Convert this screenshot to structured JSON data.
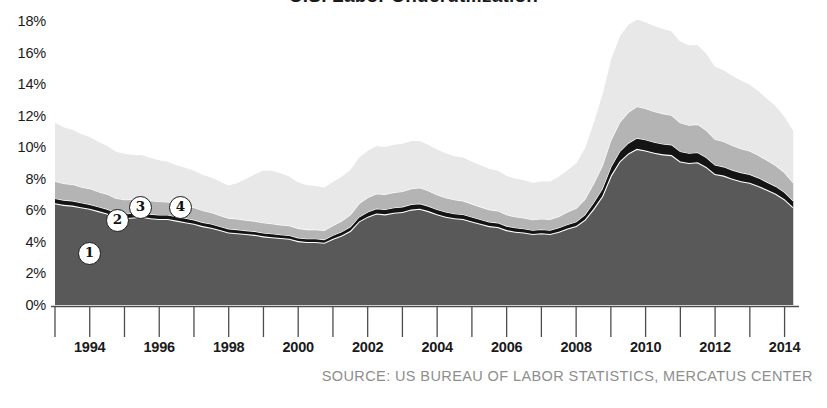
{
  "title": "U.S. Labor Underutilization",
  "source_note": "SOURCE: US BUREAU OF LABOR STATISTICS, MERCATUS CENTER",
  "axes": {
    "y_ticks": [
      "18%",
      "16%",
      "14%",
      "12%",
      "10%",
      "8%",
      "6%",
      "4%",
      "2%",
      "0%"
    ],
    "x_ticks": [
      "1994",
      "1996",
      "1998",
      "2000",
      "2002",
      "2004",
      "2006",
      "2008",
      "2010",
      "2012",
      "2014"
    ]
  },
  "markers": [
    {
      "label": "1",
      "x": 88,
      "y": 252
    },
    {
      "label": "2",
      "x": 116,
      "y": 219
    },
    {
      "label": "3",
      "x": 139,
      "y": 206
    },
    {
      "label": "4",
      "x": 179,
      "y": 206
    }
  ],
  "colors": {
    "series_1": "#595959",
    "series_2": "#141414",
    "series_3": "#b4b4b4",
    "series_4": "#e8e8e8",
    "separator": "#ffffff",
    "axis": "#4d4d4d",
    "source_text": "#8e8e8e",
    "background": "#ffffff"
  },
  "chart_data": {
    "type": "area",
    "stacked": true,
    "title": "U.S. Labor Underutilization",
    "xlabel": "",
    "ylabel": "",
    "ylim": [
      0,
      18
    ],
    "xlim": [
      1993.0,
      2014.3
    ],
    "grid": false,
    "legend": "none",
    "y_unit": "percent",
    "x": [
      1993.0,
      1993.25,
      1993.5,
      1993.75,
      1994.0,
      1994.25,
      1994.5,
      1994.75,
      1995.0,
      1995.25,
      1995.5,
      1995.75,
      1996.0,
      1996.25,
      1996.5,
      1996.75,
      1997.0,
      1997.25,
      1997.5,
      1997.75,
      1998.0,
      1998.25,
      1998.5,
      1998.75,
      1999.0,
      1999.25,
      1999.5,
      1999.75,
      2000.0,
      2000.25,
      2000.5,
      2000.75,
      2001.0,
      2001.25,
      2001.5,
      2001.75,
      2002.0,
      2002.25,
      2002.5,
      2002.75,
      2003.0,
      2003.25,
      2003.5,
      2003.75,
      2004.0,
      2004.25,
      2004.5,
      2004.75,
      2005.0,
      2005.25,
      2005.5,
      2005.75,
      2006.0,
      2006.25,
      2006.5,
      2006.75,
      2007.0,
      2007.25,
      2007.5,
      2007.75,
      2008.0,
      2008.25,
      2008.5,
      2008.75,
      2009.0,
      2009.25,
      2009.5,
      2009.75,
      2010.0,
      2010.25,
      2010.5,
      2010.75,
      2011.0,
      2011.25,
      2011.5,
      2011.75,
      2012.0,
      2012.25,
      2012.5,
      2012.75,
      2013.0,
      2013.25,
      2013.5,
      2013.75,
      2014.0,
      2014.25
    ],
    "series": [
      {
        "name": "1",
        "id": "series_1",
        "color": "#595959",
        "values": [
          6.45,
          6.35,
          6.3,
          6.2,
          6.1,
          5.95,
          5.8,
          5.6,
          5.5,
          5.55,
          5.6,
          5.5,
          5.45,
          5.45,
          5.35,
          5.25,
          5.15,
          5.0,
          4.9,
          4.75,
          4.6,
          4.55,
          4.5,
          4.45,
          4.35,
          4.3,
          4.25,
          4.2,
          4.05,
          4.0,
          4.0,
          3.95,
          4.2,
          4.4,
          4.7,
          5.3,
          5.6,
          5.8,
          5.75,
          5.85,
          5.9,
          6.05,
          6.1,
          5.95,
          5.75,
          5.6,
          5.5,
          5.45,
          5.3,
          5.15,
          5.0,
          4.95,
          4.75,
          4.65,
          4.6,
          4.5,
          4.55,
          4.5,
          4.65,
          4.85,
          5.0,
          5.4,
          6.1,
          6.9,
          8.2,
          9.1,
          9.6,
          9.9,
          9.8,
          9.65,
          9.55,
          9.5,
          9.1,
          9.0,
          9.05,
          8.75,
          8.3,
          8.2,
          8.0,
          7.85,
          7.75,
          7.55,
          7.3,
          7.05,
          6.7,
          6.2
        ]
      },
      {
        "name": "2",
        "id": "series_2",
        "color": "#141414",
        "values": [
          0.3,
          0.3,
          0.3,
          0.28,
          0.28,
          0.28,
          0.28,
          0.27,
          0.27,
          0.27,
          0.27,
          0.26,
          0.26,
          0.26,
          0.25,
          0.25,
          0.25,
          0.24,
          0.24,
          0.23,
          0.23,
          0.23,
          0.22,
          0.22,
          0.22,
          0.22,
          0.21,
          0.21,
          0.21,
          0.2,
          0.2,
          0.2,
          0.22,
          0.24,
          0.26,
          0.28,
          0.3,
          0.31,
          0.31,
          0.32,
          0.32,
          0.33,
          0.33,
          0.32,
          0.31,
          0.3,
          0.29,
          0.29,
          0.28,
          0.27,
          0.27,
          0.26,
          0.25,
          0.25,
          0.24,
          0.24,
          0.24,
          0.24,
          0.25,
          0.26,
          0.28,
          0.32,
          0.38,
          0.46,
          0.55,
          0.62,
          0.66,
          0.68,
          0.68,
          0.67,
          0.66,
          0.65,
          0.63,
          0.62,
          0.62,
          0.6,
          0.57,
          0.56,
          0.55,
          0.54,
          0.53,
          0.51,
          0.49,
          0.47,
          0.44,
          0.4
        ]
      },
      {
        "name": "3",
        "id": "series_3",
        "color": "#b4b4b4",
        "values": [
          1.1,
          1.05,
          1.05,
          1.0,
          1.0,
          0.95,
          0.95,
          0.9,
          0.9,
          0.88,
          0.88,
          0.85,
          0.85,
          0.82,
          0.8,
          0.78,
          0.78,
          0.75,
          0.72,
          0.7,
          0.68,
          0.68,
          0.66,
          0.65,
          0.65,
          0.63,
          0.62,
          0.62,
          0.6,
          0.58,
          0.58,
          0.58,
          0.62,
          0.68,
          0.75,
          0.85,
          0.92,
          0.95,
          0.95,
          0.97,
          0.98,
          1.0,
          1.0,
          0.97,
          0.93,
          0.9,
          0.88,
          0.86,
          0.83,
          0.8,
          0.78,
          0.76,
          0.72,
          0.7,
          0.68,
          0.67,
          0.68,
          0.68,
          0.72,
          0.78,
          0.85,
          0.98,
          1.2,
          1.45,
          1.7,
          1.85,
          1.95,
          2.0,
          1.98,
          1.95,
          1.92,
          1.88,
          1.82,
          1.78,
          1.78,
          1.72,
          1.63,
          1.6,
          1.56,
          1.52,
          1.48,
          1.43,
          1.38,
          1.32,
          1.25,
          1.15
        ]
      },
      {
        "name": "4",
        "id": "series_4",
        "color": "#e8e8e8",
        "values": [
          3.75,
          3.6,
          3.5,
          3.4,
          3.3,
          3.2,
          3.1,
          3.0,
          2.95,
          2.85,
          2.8,
          2.75,
          2.65,
          2.58,
          2.5,
          2.45,
          2.38,
          2.3,
          2.25,
          2.18,
          2.1,
          2.3,
          2.65,
          3.0,
          3.35,
          3.4,
          3.3,
          3.15,
          2.95,
          2.85,
          2.8,
          2.75,
          2.8,
          2.85,
          2.9,
          2.95,
          3.0,
          3.05,
          3.05,
          3.05,
          3.05,
          3.05,
          3.0,
          2.95,
          2.9,
          2.85,
          2.8,
          2.78,
          2.72,
          2.68,
          2.62,
          2.58,
          2.5,
          2.45,
          2.42,
          2.38,
          2.4,
          2.45,
          2.55,
          2.7,
          2.9,
          3.3,
          3.95,
          4.6,
          5.2,
          5.5,
          5.6,
          5.55,
          5.5,
          5.45,
          5.4,
          5.35,
          5.2,
          5.1,
          5.05,
          4.9,
          4.65,
          4.55,
          4.45,
          4.35,
          4.25,
          4.1,
          3.95,
          3.8,
          3.6,
          3.35
        ]
      }
    ]
  }
}
